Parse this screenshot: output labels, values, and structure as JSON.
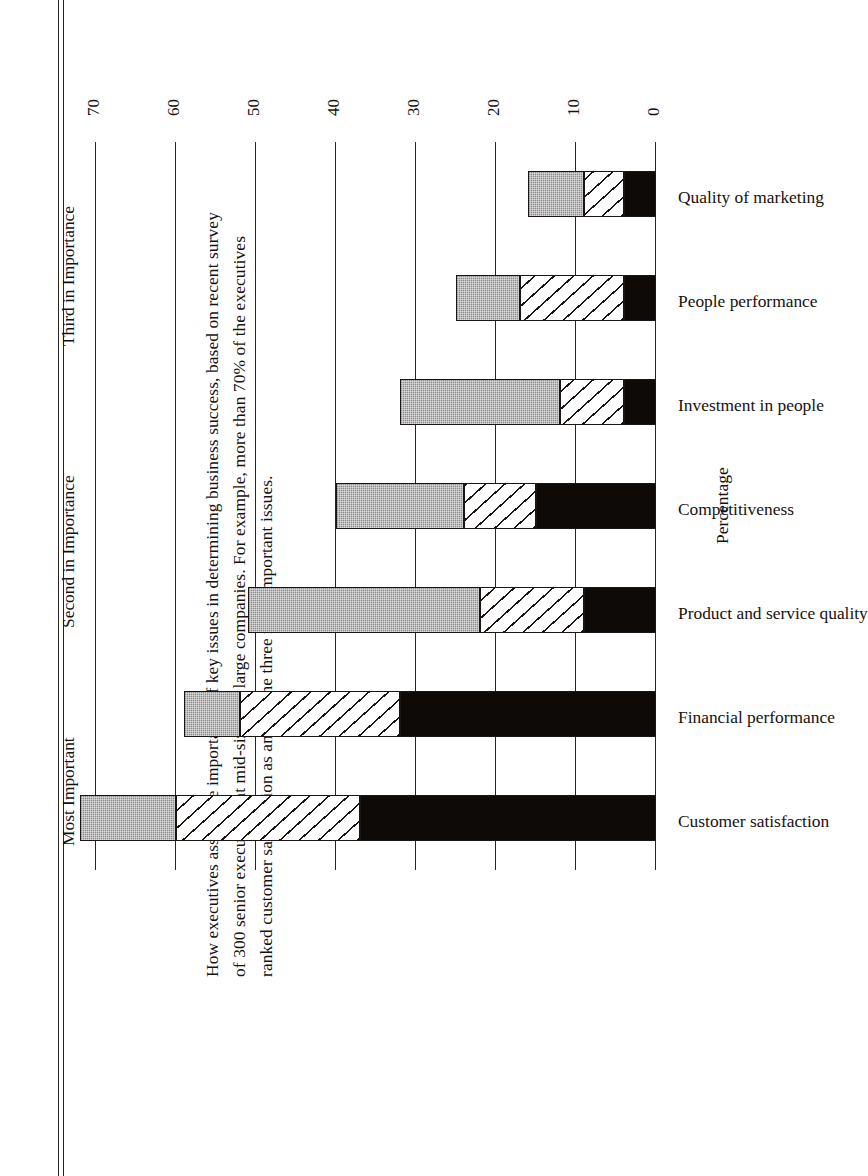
{
  "caption": {
    "lines": [
      "How executives assess the importance of key issues in determining business success, based on recent survey",
      "of 300 senior executives at mid-size and large companies. For example, more than 70% of the executives",
      "ranked customer satisfaction as among the three most important issues."
    ]
  },
  "legend": {
    "items": [
      {
        "label": "Most Important",
        "key": "s1",
        "pattern": "solid-black"
      },
      {
        "label": "Second in Importance",
        "key": "s2",
        "pattern": "diagonal-hatch"
      },
      {
        "label": "Third in Importance",
        "key": "s3",
        "pattern": "gray-stipple"
      }
    ]
  },
  "axis": {
    "label": "Percentage",
    "ticks": [
      "0",
      "10",
      "20",
      "30",
      "40",
      "50",
      "60",
      "70"
    ],
    "min": 0,
    "max": 70
  },
  "chart_data": {
    "type": "bar",
    "stacked": true,
    "orientation": "vertical",
    "title": "",
    "xlabel": "",
    "ylabel": "Percentage",
    "ylim": [
      0,
      70
    ],
    "grid": true,
    "legend_position": "top",
    "categories": [
      "Customer satisfaction",
      "Financial performance",
      "Product and service quality",
      "Competitiveness",
      "Investment in people",
      "People performance",
      "Quality of marketing"
    ],
    "series": [
      {
        "name": "Most Important",
        "values": [
          37,
          32,
          9,
          15,
          4,
          4,
          4
        ]
      },
      {
        "name": "Second in Importance",
        "values": [
          23,
          20,
          13,
          9,
          8,
          13,
          5
        ]
      },
      {
        "name": "Third in Importance",
        "values": [
          12,
          7,
          29,
          16,
          20,
          8,
          7
        ]
      }
    ],
    "totals": [
      72,
      59,
      51,
      40,
      32,
      25,
      16
    ]
  },
  "colors": {
    "most_important": "#0d0a08",
    "second_in_importance": "#ffffff",
    "third_in_importance": "#8d8d8d",
    "ink": "#1b1613",
    "paper": "#ffffff"
  }
}
